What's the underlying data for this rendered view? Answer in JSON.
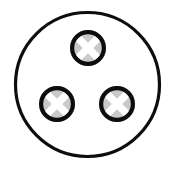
{
  "canvas": {
    "width": 174,
    "height": 169,
    "background_color": "#ffffff"
  },
  "figure": {
    "name": "three-node-circular-symbol",
    "outline_color": "#0d0d0d",
    "node_ring_color": "#0d0d0d",
    "node_fill_color": "#c9c9c9",
    "node_cross_color": "#ffffff"
  },
  "outer_circle": {
    "label": "outer-boundary-circle",
    "cx": 87.5,
    "cy": 84.5,
    "r": 72,
    "stroke_width": 3.2,
    "fill": "none",
    "stroke": "#0d0d0d"
  },
  "nodes": [
    {
      "id": "node-top",
      "label": "top-cross-circle",
      "cx": 88,
      "cy": 48,
      "r": 18,
      "ring_width": 4.2,
      "cross_arm_width": 7.5,
      "fill": "#c9c9c9",
      "ring": "#0d0d0d",
      "cross": "#ffffff"
    },
    {
      "id": "node-bottom-left",
      "label": "bottom-left-cross-circle",
      "cx": 57,
      "cy": 104,
      "r": 18,
      "ring_width": 4.2,
      "cross_arm_width": 7.5,
      "fill": "#c9c9c9",
      "ring": "#0d0d0d",
      "cross": "#ffffff"
    },
    {
      "id": "node-bottom-right",
      "label": "bottom-right-cross-circle",
      "cx": 117,
      "cy": 104,
      "r": 18,
      "ring_width": 4.2,
      "cross_arm_width": 7.5,
      "fill": "#c9c9c9",
      "ring": "#0d0d0d",
      "cross": "#ffffff"
    }
  ]
}
